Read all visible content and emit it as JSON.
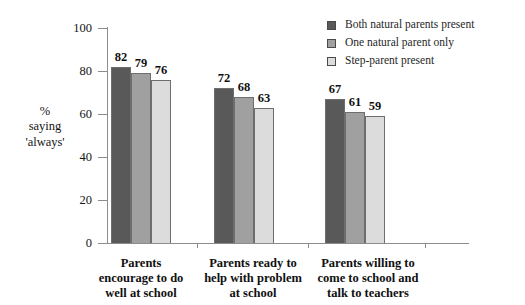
{
  "chart_data": {
    "type": "bar",
    "title": "",
    "xlabel": "",
    "ylabel": "% saying 'always'",
    "ylim": [
      0,
      100
    ],
    "ytick_step": 20,
    "grid": false,
    "legend_position": "top-right",
    "categories": [
      "Parents encourage to do well at school",
      "Parents ready to help with problem at school",
      "Parents willing to come to school and talk to teachers"
    ],
    "series": [
      {
        "name": "Both natural parents present",
        "color": "#595959",
        "values": [
          82,
          72,
          67
        ]
      },
      {
        "name": "One natural parent only",
        "color": "#a0a0a0",
        "values": [
          79,
          68,
          61
        ]
      },
      {
        "name": "Step-parent present",
        "color": "#dcdcdc",
        "values": [
          76,
          63,
          59
        ]
      }
    ]
  },
  "axis": {
    "title_lines": [
      "%",
      "saying",
      "'always'"
    ],
    "ytick_labels": [
      "100",
      "80",
      "60",
      "40",
      "20",
      "0"
    ]
  },
  "legend": {
    "items": [
      {
        "label": "Both natural parents present",
        "color": "#595959"
      },
      {
        "label": "One natural parent only",
        "color": "#a0a0a0"
      },
      {
        "label": "Step-parent present",
        "color": "#dcdcdc"
      }
    ]
  },
  "categories_wrapped": [
    [
      "Parents",
      "encourage to do",
      "well at school"
    ],
    [
      "Parents ready to",
      "help with problem",
      "at school"
    ],
    [
      "Parents willing to",
      "come to school and",
      "talk to teachers"
    ]
  ],
  "values": {
    "g0": [
      "82",
      "79",
      "76"
    ],
    "g1": [
      "72",
      "68",
      "63"
    ],
    "g2": [
      "67",
      "61",
      "59"
    ]
  }
}
